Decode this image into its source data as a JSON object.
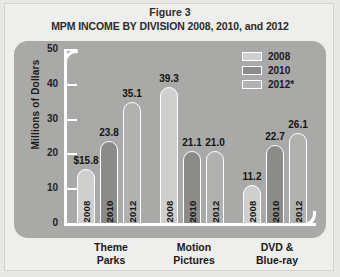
{
  "figure": {
    "label": "Figure 3",
    "title": "MPM INCOME BY DIVISION 2008, 2010, and 2012"
  },
  "colors": {
    "panel": "#a9a9a7",
    "axis": "#ffffff",
    "bar_2008": "#cfcfcd",
    "bar_2010": "#8b8b89",
    "bar_2012": "#b1b1af",
    "text": "#1a1a1a",
    "page_background": "#eeeeec"
  },
  "legend": {
    "position": "top-right",
    "entries": [
      {
        "label": "2008",
        "swatch": "legend-swatch-2008"
      },
      {
        "label": "2010",
        "swatch": "legend-swatch-2010"
      },
      {
        "label": "2012*",
        "swatch": "legend-swatch-2012"
      }
    ]
  },
  "axis": {
    "y_title": "Millions of Dollars",
    "y_ticks": [
      "50",
      "40",
      "30",
      "20",
      "10",
      "0"
    ]
  },
  "bars": [
    {
      "group": 0,
      "series": "2008",
      "year_label": "2008",
      "value_label": "$15.8",
      "value": 15.8
    },
    {
      "group": 0,
      "series": "2010",
      "year_label": "2010",
      "value_label": "23.8",
      "value": 23.8
    },
    {
      "group": 0,
      "series": "2012",
      "year_label": "2012",
      "value_label": "35.1",
      "value": 35.1
    },
    {
      "group": 1,
      "series": "2008",
      "year_label": "2008",
      "value_label": "39.3",
      "value": 39.3
    },
    {
      "group": 1,
      "series": "2010",
      "year_label": "2010",
      "value_label": "21.1",
      "value": 21.1
    },
    {
      "group": 1,
      "series": "2012",
      "year_label": "2012",
      "value_label": "21.0",
      "value": 21.0
    },
    {
      "group": 2,
      "series": "2008",
      "year_label": "2008",
      "value_label": "11.2",
      "value": 11.2
    },
    {
      "group": 2,
      "series": "2010",
      "year_label": "2010",
      "value_label": "22.7",
      "value": 22.7
    },
    {
      "group": 2,
      "series": "2012",
      "year_label": "2012",
      "value_label": "26.1",
      "value": 26.1
    }
  ],
  "categories": [
    {
      "line1": "Theme",
      "line2": "Parks"
    },
    {
      "line1": "Motion",
      "line2": "Pictures"
    },
    {
      "line1": "DVD &",
      "line2": "Blue-ray"
    }
  ],
  "chart_data": {
    "type": "bar",
    "title": "MPM INCOME BY DIVISION 2008, 2010, and 2012",
    "subtitle": "Figure 3",
    "xlabel": "",
    "ylabel": "Millions of Dollars",
    "ylim": [
      0,
      50
    ],
    "yticks": [
      0,
      10,
      20,
      30,
      40,
      50
    ],
    "grid": false,
    "legend_position": "top-right",
    "categories": [
      "Theme Parks",
      "Motion Pictures",
      "DVD & Blue-ray"
    ],
    "series": [
      {
        "name": "2008",
        "values": [
          15.8,
          39.3,
          11.2
        ],
        "color": "#cfcfcd"
      },
      {
        "name": "2010",
        "values": [
          23.8,
          21.1,
          22.7
        ],
        "color": "#8b8b89"
      },
      {
        "name": "2012*",
        "values": [
          35.1,
          21.0,
          26.1
        ],
        "color": "#b1b1af"
      }
    ],
    "data_labels": [
      "$15.8",
      "23.8",
      "35.1",
      "39.3",
      "21.1",
      "21.0",
      "11.2",
      "22.7",
      "26.1"
    ],
    "in_bar_labels": [
      "2008",
      "2010",
      "2012",
      "2008",
      "2010",
      "2012",
      "2008",
      "2010",
      "2012"
    ],
    "annotations": [
      "* denotes 2012 figures"
    ]
  }
}
